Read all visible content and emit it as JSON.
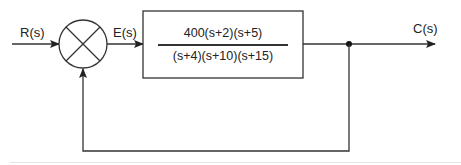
{
  "diagram": {
    "type": "closed-loop negative feedback block diagram",
    "signals": {
      "input": "R(s)",
      "error": "E(s)",
      "output": "C(s)"
    },
    "summing_junction": {
      "symbol": "X-circle"
    },
    "forward_block": {
      "numerator": "400(s+2)(s+5)",
      "denominator": "(s+4)(s+10)(s+15)"
    },
    "feedback": "unity",
    "colors": {
      "line": "#333333",
      "background": "#ffffff"
    }
  }
}
